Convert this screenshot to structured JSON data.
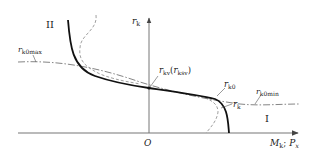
{
  "diagram": {
    "axes": {
      "y_label": "r",
      "y_label_sub": "k",
      "x_label_1": "M",
      "x_label_1_sub": "k",
      "x_label_sep": ";",
      "x_label_2": "P",
      "x_label_2_sub": "x",
      "origin": "O"
    },
    "regions": {
      "left": "II",
      "right": "I"
    },
    "curve_labels": {
      "rk0max": {
        "main": "r",
        "sub": "k0max"
      },
      "rk0min": {
        "main": "r",
        "sub": "k0min"
      },
      "rk0": {
        "main": "r",
        "sub": "k0"
      },
      "rk": {
        "main": "r",
        "sub": "k"
      },
      "rkv": {
        "main": "r",
        "sub": "kv",
        "paren_open": "(",
        "paren_main": "r",
        "paren_sub": "ksv",
        "paren_close": ")"
      }
    },
    "colors": {
      "ink": "#222222",
      "axis": "#666666",
      "dashed": "#888888"
    }
  }
}
